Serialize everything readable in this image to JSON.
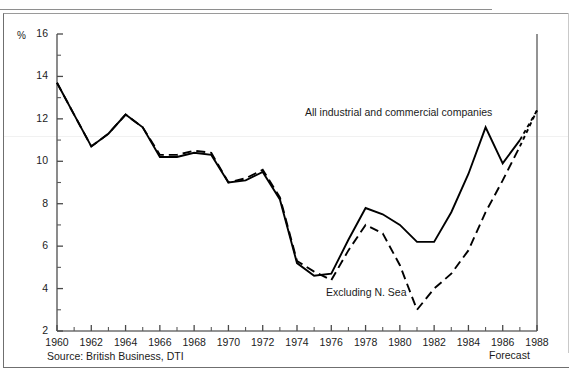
{
  "figure": {
    "cropped_caption_above": "",
    "source_note": "Source: British Business, DTI",
    "forecast_label": "Forecast"
  },
  "chart_data": {
    "type": "line",
    "title": "",
    "subtitle": "",
    "xlabel": "",
    "ylabel": "%",
    "y_unit_symbol": "%",
    "xlim": [
      1960,
      1988
    ],
    "ylim": [
      2,
      16
    ],
    "y_ticks": [
      2,
      4,
      6,
      8,
      10,
      12,
      14,
      16
    ],
    "y_minor_ticks": [
      3,
      5,
      7,
      9,
      11,
      13,
      15
    ],
    "x_ticks": [
      1960,
      1962,
      1964,
      1966,
      1968,
      1970,
      1972,
      1974,
      1976,
      1978,
      1980,
      1982,
      1984,
      1986,
      1988
    ],
    "x_minor_ticks": [
      1961,
      1963,
      1965,
      1967,
      1969,
      1971,
      1973,
      1975,
      1977,
      1979,
      1981,
      1983,
      1985,
      1987
    ],
    "grid": false,
    "legend_position": "inline-annotation",
    "annotations": [
      {
        "text": "All industrial and commercial companies",
        "x": 1974,
        "y": 11.6
      },
      {
        "text": "Excluding N. Sea",
        "x": 1977.5,
        "y": 3.3
      },
      {
        "text": "Forecast",
        "x": 1988,
        "y": 1.2
      }
    ],
    "x": [
      1960,
      1961,
      1962,
      1963,
      1964,
      1965,
      1966,
      1967,
      1968,
      1969,
      1970,
      1971,
      1972,
      1973,
      1974,
      1975,
      1976,
      1977,
      1978,
      1979,
      1980,
      1981,
      1982,
      1983,
      1984,
      1985,
      1986,
      1987,
      1988
    ],
    "series": [
      {
        "name": "All industrial and commercial companies",
        "style": "solid",
        "color": "#000000",
        "values": [
          13.7,
          12.2,
          10.7,
          11.3,
          12.2,
          11.6,
          10.2,
          10.2,
          10.4,
          10.3,
          9.0,
          9.1,
          9.5,
          8.2,
          5.2,
          4.6,
          4.7,
          6.3,
          7.8,
          7.5,
          7.0,
          6.2,
          6.2,
          7.6,
          9.4,
          11.6,
          9.9,
          11.0,
          12.4
        ],
        "forecast_from": 1987
      },
      {
        "name": "Excluding N. Sea",
        "style": "dashed",
        "color": "#000000",
        "values": [
          13.7,
          12.2,
          10.7,
          11.3,
          12.2,
          11.6,
          10.3,
          10.3,
          10.5,
          10.4,
          9.0,
          9.2,
          9.6,
          8.3,
          5.3,
          4.8,
          4.4,
          5.8,
          7.0,
          6.6,
          5.1,
          3.0,
          4.0,
          4.7,
          5.8,
          7.6,
          9.1,
          10.7,
          12.4
        ],
        "forecast_from": 1987
      }
    ]
  }
}
